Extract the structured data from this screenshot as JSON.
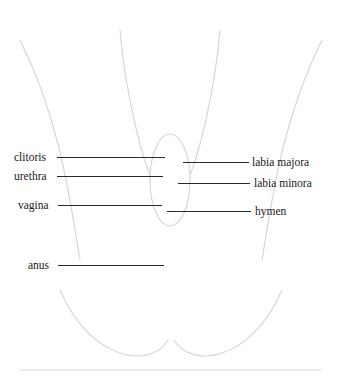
{
  "diagram": {
    "title": "",
    "style": "pencil anatomical illustration",
    "colors": {
      "line": "#2a2a2a",
      "text": "#1a1a1a",
      "sketch": "#d6d6d6",
      "background": "#ffffff"
    },
    "labels": {
      "left": [
        {
          "id": "clitoris",
          "text": "clitoris"
        },
        {
          "id": "urethra",
          "text": "urethra"
        },
        {
          "id": "vagina",
          "text": "vagina"
        },
        {
          "id": "anus",
          "text": "anus"
        }
      ],
      "right": [
        {
          "id": "labia-majora",
          "text": "labia majora"
        },
        {
          "id": "labia-minora",
          "text": "labia minora"
        },
        {
          "id": "hymen",
          "text": "hymen"
        }
      ]
    }
  }
}
